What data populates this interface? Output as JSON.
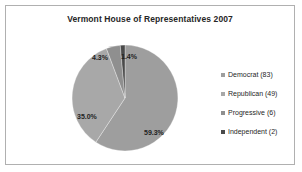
{
  "chart_data": {
    "type": "pie",
    "title": "Vermont House of Representatives 2007",
    "xlabel": "",
    "ylabel": "",
    "legend_position": "right",
    "grid": false,
    "total": 140,
    "categories": [
      "Democrat",
      "Republican",
      "Progressive",
      "Independent"
    ],
    "values": [
      83,
      49,
      6,
      2
    ],
    "percent_labels": [
      "59.3%",
      "35.0%",
      "4.3%",
      "1.4%"
    ],
    "percents": [
      59.3,
      35.0,
      4.3,
      1.4
    ],
    "legend_labels": [
      "Democrat (83)",
      "Republican (49)",
      "Progressive (6)",
      "Independent (2)"
    ],
    "colors": [
      "#9e9e9e",
      "#a8a8a8",
      "#8f8f8f",
      "#4a4a4a"
    ],
    "start_angle_deg": 0,
    "direction": "clockwise",
    "slices": [
      {
        "name": "Democrat",
        "value": 83,
        "percent_label": "59.3%",
        "color": "#9e9e9e",
        "legend_label": "Democrat (83)"
      },
      {
        "name": "Republican",
        "value": 49,
        "percent_label": "35.0%",
        "color": "#a8a8a8",
        "legend_label": "Republican (49)"
      },
      {
        "name": "Progressive",
        "value": 6,
        "percent_label": "4.3%",
        "color": "#8f8f8f",
        "legend_label": "Progressive (6)"
      },
      {
        "name": "Independent",
        "value": 2,
        "percent_label": "1.4%",
        "color": "#4a4a4a",
        "legend_label": "Independent (2)"
      }
    ]
  },
  "frame": {
    "border_color": "#b0b0b0",
    "background": "#ffffff"
  }
}
